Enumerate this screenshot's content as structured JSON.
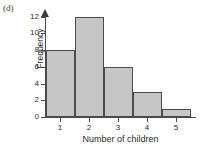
{
  "panel": {
    "label": "(d)"
  },
  "colors": {
    "bar_fill": "#c6c6c6",
    "bar_edge": "#4b4b4b",
    "axis": "#4a4a4a",
    "text": "#2b2b2b",
    "background": "#ffffff"
  },
  "chart_data": {
    "type": "bar",
    "title": "",
    "subtitle": "",
    "xlabel": "Number of children",
    "ylabel": "Frequency",
    "categories": [
      "1",
      "2",
      "3",
      "4",
      "5"
    ],
    "values": [
      8,
      12,
      6,
      3,
      1
    ],
    "series": [
      {
        "name": "Frequency",
        "values": [
          8,
          12,
          6,
          3,
          1
        ]
      }
    ],
    "ylim": [
      0,
      13
    ],
    "yticks": [
      0,
      2,
      4,
      6,
      8,
      10,
      12
    ],
    "ytick_labels": [
      "0",
      "2",
      "4",
      "6",
      "8",
      "10",
      "12"
    ],
    "xticks": [
      1,
      2,
      3,
      4,
      5
    ],
    "xtick_labels": [
      "1",
      "2",
      "3",
      "4",
      "5"
    ],
    "grid": false,
    "legend": false,
    "legend_position": "none",
    "annotations": [
      "(d)"
    ],
    "bar_style": "adjacent-histogram",
    "y_axis_arrow": true
  }
}
